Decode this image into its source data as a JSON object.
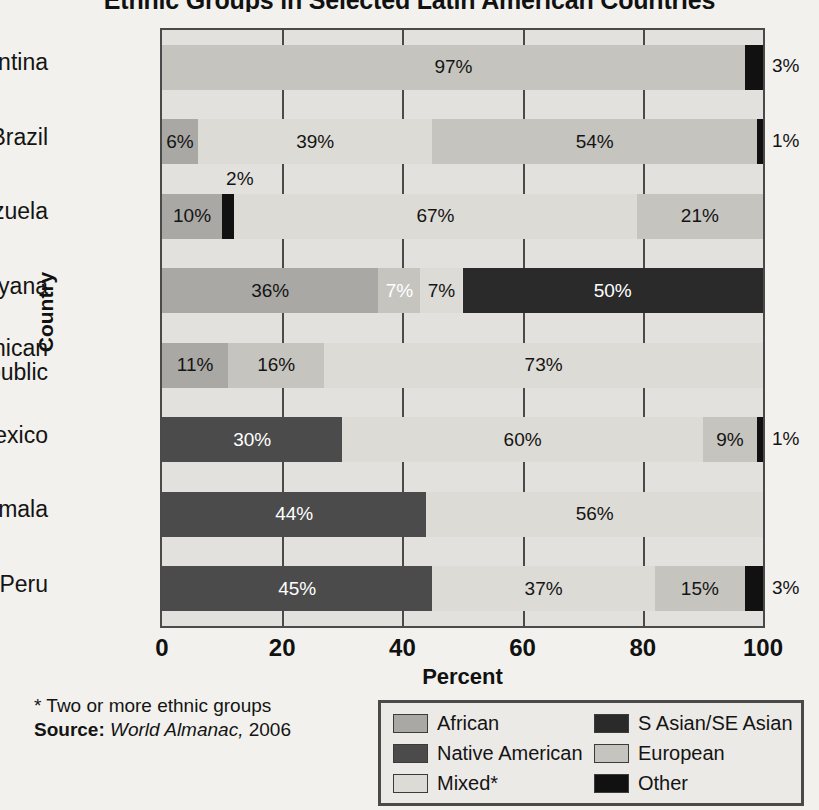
{
  "chart_data": {
    "type": "bar",
    "orientation": "horizontal",
    "stacked": true,
    "title": "Ethnic Groups in Selected Latin American Countries",
    "xlabel": "Percent",
    "ylabel": "Country",
    "xlim": [
      0,
      100
    ],
    "xticks": [
      "0",
      "20",
      "40",
      "60",
      "80",
      "100"
    ],
    "grid": true,
    "legend_position": "bottom-right",
    "categories": [
      "Argentina",
      "Brazil",
      "Venezuela",
      "Guyana",
      "Dominican Republic",
      "Mexico",
      "Guatemala",
      "Peru"
    ],
    "series": [
      {
        "name": "African",
        "key": "african",
        "color": "#a9a8a4",
        "values": [
          0,
          6,
          10,
          36,
          11,
          0,
          0,
          0
        ]
      },
      {
        "name": "Native American",
        "key": "native",
        "color": "#4b4b4b",
        "values": [
          0,
          0,
          0,
          0,
          0,
          30,
          44,
          45
        ]
      },
      {
        "name": "Mixed*",
        "key": "mixed",
        "color": "#dddbd6",
        "values": [
          0,
          39,
          67,
          7,
          73,
          60,
          56,
          37
        ]
      },
      {
        "name": "S Asian/SE Asian",
        "key": "sasian",
        "color": "#2a2a2a",
        "values": [
          0,
          0,
          0,
          50,
          0,
          0,
          0,
          0
        ]
      },
      {
        "name": "European",
        "key": "european",
        "color": "#c6c4bf",
        "values": [
          97,
          54,
          21,
          7,
          16,
          9,
          0,
          15
        ]
      },
      {
        "name": "Other",
        "key": "other",
        "color": "#111111",
        "values": [
          3,
          1,
          2,
          0,
          0,
          1,
          0,
          3
        ]
      }
    ],
    "rows": [
      {
        "country": "Argentina",
        "segments": [
          {
            "key": "european",
            "value": 97,
            "label": "97%",
            "label_pos": "inside",
            "text": "dark"
          },
          {
            "key": "other",
            "value": 3,
            "label": "3%",
            "label_pos": "right-outside"
          }
        ]
      },
      {
        "country": "Brazil",
        "segments": [
          {
            "key": "african",
            "value": 6,
            "label": "6%",
            "label_pos": "inside",
            "text": "dark"
          },
          {
            "key": "mixed",
            "value": 39,
            "label": "39%",
            "label_pos": "inside",
            "text": "dark"
          },
          {
            "key": "european",
            "value": 54,
            "label": "54%",
            "label_pos": "inside",
            "text": "dark"
          },
          {
            "key": "other",
            "value": 1,
            "label": "1%",
            "label_pos": "right-outside"
          }
        ]
      },
      {
        "country": "Venezuela",
        "segments": [
          {
            "key": "african",
            "value": 10,
            "label": "10%",
            "label_pos": "inside",
            "text": "dark"
          },
          {
            "key": "other",
            "value": 2,
            "label": "2%",
            "label_pos": "above"
          },
          {
            "key": "mixed",
            "value": 67,
            "label": "67%",
            "label_pos": "inside",
            "text": "dark"
          },
          {
            "key": "european",
            "value": 21,
            "label": "21%",
            "label_pos": "inside",
            "text": "dark"
          }
        ]
      },
      {
        "country": "Guyana",
        "segments": [
          {
            "key": "african",
            "value": 36,
            "label": "36%",
            "label_pos": "inside",
            "text": "dark"
          },
          {
            "key": "european",
            "value": 7,
            "label": "7%",
            "label_pos": "inside",
            "text": "light"
          },
          {
            "key": "mixed",
            "value": 7,
            "label": "7%",
            "label_pos": "inside",
            "text": "dark"
          },
          {
            "key": "sasian",
            "value": 50,
            "label": "50%",
            "label_pos": "inside",
            "text": "light"
          }
        ]
      },
      {
        "country": "Dominican Republic",
        "segments": [
          {
            "key": "african",
            "value": 11,
            "label": "11%",
            "label_pos": "inside",
            "text": "dark"
          },
          {
            "key": "european",
            "value": 16,
            "label": "16%",
            "label_pos": "inside",
            "text": "dark"
          },
          {
            "key": "mixed",
            "value": 73,
            "label": "73%",
            "label_pos": "inside",
            "text": "dark"
          }
        ]
      },
      {
        "country": "Mexico",
        "segments": [
          {
            "key": "native",
            "value": 30,
            "label": "30%",
            "label_pos": "inside",
            "text": "light"
          },
          {
            "key": "mixed",
            "value": 60,
            "label": "60%",
            "label_pos": "inside",
            "text": "dark"
          },
          {
            "key": "european",
            "value": 9,
            "label": "9%",
            "label_pos": "inside",
            "text": "dark"
          },
          {
            "key": "other",
            "value": 1,
            "label": "1%",
            "label_pos": "right-outside"
          }
        ]
      },
      {
        "country": "Guatemala",
        "segments": [
          {
            "key": "native",
            "value": 44,
            "label": "44%",
            "label_pos": "inside",
            "text": "light"
          },
          {
            "key": "mixed",
            "value": 56,
            "label": "56%",
            "label_pos": "inside",
            "text": "dark"
          }
        ]
      },
      {
        "country": "Peru",
        "segments": [
          {
            "key": "native",
            "value": 45,
            "label": "45%",
            "label_pos": "inside",
            "text": "light"
          },
          {
            "key": "mixed",
            "value": 37,
            "label": "37%",
            "label_pos": "inside",
            "text": "dark"
          },
          {
            "key": "european",
            "value": 15,
            "label": "15%",
            "label_pos": "inside",
            "text": "dark"
          },
          {
            "key": "other",
            "value": 3,
            "label": "3%",
            "label_pos": "right-outside"
          }
        ]
      }
    ]
  },
  "notes": {
    "footnote": "* Two or more ethnic groups",
    "source_label": "Source:",
    "source_name": "World Almanac,",
    "source_year": "2006"
  }
}
